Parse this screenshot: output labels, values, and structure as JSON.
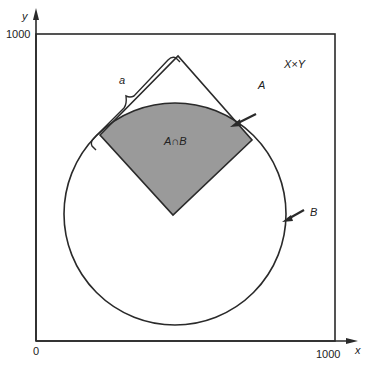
{
  "diagram": {
    "type": "set-diagram",
    "axes": {
      "x_label": "x",
      "y_label": "y",
      "x_origin_label": "0",
      "x_max_label": "1000",
      "y_max_label": "1000",
      "range": [
        0,
        1000
      ]
    },
    "universe_label": "X×Y",
    "set_a_label": "A",
    "set_b_label": "B",
    "intersection_label": "A∩B",
    "side_label": "a",
    "colors": {
      "line": "#2a2a2a",
      "intersection_fill": "#9a9a9a",
      "background": "#ffffff"
    }
  }
}
